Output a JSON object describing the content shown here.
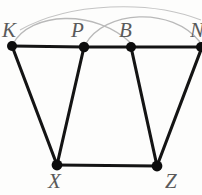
{
  "figure": {
    "kind": "graph-diagram",
    "background_color": "#fdfdfc",
    "edge_color": "#141414",
    "vertex_color": "#0d0d0d",
    "arc_color": "#b9b9b9",
    "label_color": "#5a5a5a",
    "width": 202,
    "height": 195,
    "vertices": [
      {
        "id": "K",
        "label": "K",
        "x": 12,
        "y": 46,
        "r": 5.0,
        "clipped": false
      },
      {
        "id": "P",
        "label": "P",
        "x": 84,
        "y": 47,
        "r": 5.2,
        "clipped": false
      },
      {
        "id": "B",
        "label": "B",
        "x": 131,
        "y": 47,
        "r": 5.0,
        "clipped": false
      },
      {
        "id": "N",
        "label": "N",
        "x": 201,
        "y": 47,
        "r": 5.0,
        "clipped": true
      },
      {
        "id": "X",
        "label": "X",
        "x": 57,
        "y": 165,
        "r": 5.4,
        "clipped": false
      },
      {
        "id": "Z",
        "label": "Z",
        "x": 157,
        "y": 166,
        "r": 5.4,
        "clipped": false
      }
    ],
    "edges": [
      {
        "from": "K",
        "to": "P"
      },
      {
        "from": "P",
        "to": "B"
      },
      {
        "from": "B",
        "to": "N"
      },
      {
        "from": "K",
        "to": "X"
      },
      {
        "from": "P",
        "to": "X"
      },
      {
        "from": "B",
        "to": "Z"
      },
      {
        "from": "N",
        "to": "Z"
      },
      {
        "from": "X",
        "to": "Z"
      }
    ],
    "arcs": [
      {
        "from": "K",
        "to": "B",
        "d": "M 13 44 C 30 12, 95 8, 132 44"
      },
      {
        "from": "P",
        "to": "N",
        "d": "M 85 45 C 104 10, 172 6, 200 42"
      },
      {
        "from": "K",
        "to": "N",
        "d": "M 20 30 C 70 2, 150 0, 201 20"
      }
    ],
    "labels": {
      "K": "K",
      "P": "P",
      "B": "B",
      "N": "N",
      "X": "X",
      "Z": "Z"
    }
  }
}
